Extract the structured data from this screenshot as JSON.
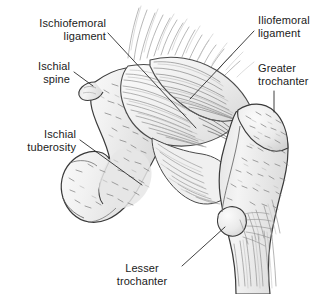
{
  "figure": {
    "background_color": "#ffffff",
    "width": 320,
    "height": 294,
    "ink_color": "#1b1b1b",
    "bone_fill": "#efefef",
    "bone_shade": "#d8d8d8",
    "ligament_fill": "#f4f4f4",
    "line_color": "#2b2b2b"
  },
  "labels": [
    {
      "id": "ischiofemoral-ligament",
      "text": "Ischiofemoral\nligament",
      "align": "right",
      "x": 14,
      "y": 17,
      "width": 92,
      "leader": {
        "x1": 108,
        "y1": 33,
        "x2": 196,
        "y2": 128
      }
    },
    {
      "id": "ischial-spine",
      "text": "Ischial\nspine",
      "align": "right",
      "x": 8,
      "y": 60,
      "width": 62,
      "leader": {
        "x1": 74,
        "y1": 72,
        "x2": 93,
        "y2": 86
      }
    },
    {
      "id": "ischial-tuberosity",
      "text": "Ischial\ntuberosity",
      "align": "right",
      "x": 4,
      "y": 128,
      "width": 72,
      "leader": {
        "x1": 80,
        "y1": 140,
        "x2": 142,
        "y2": 185
      }
    },
    {
      "id": "iliofemoral-ligament",
      "text": "Iliofemoral\nligament",
      "align": "left",
      "x": 258,
      "y": 14,
      "width": 62,
      "leader": {
        "x1": 254,
        "y1": 31,
        "x2": 190,
        "y2": 99
      }
    },
    {
      "id": "greater-trochanter",
      "text": "Greater\ntrochanter",
      "align": "left",
      "x": 258,
      "y": 62,
      "width": 62,
      "leader": {
        "x1": 274,
        "y1": 91,
        "x2": 274,
        "y2": 112
      }
    },
    {
      "id": "lesser-trochanter",
      "text": "Lesser\ntrochanter",
      "align": "center",
      "x": 104,
      "y": 262,
      "width": 76,
      "leader": {
        "x1": 182,
        "y1": 266,
        "x2": 225,
        "y2": 227
      }
    }
  ],
  "structures": [
    {
      "id": "ischium",
      "name": "Ischium"
    },
    {
      "id": "ischial-spine-landmark",
      "name": "Ischial spine"
    },
    {
      "id": "ischial-tuberosity-landmark",
      "name": "Ischial tuberosity"
    },
    {
      "id": "ischiofemoral-ligament-band",
      "name": "Ischiofemoral ligament"
    },
    {
      "id": "iliofemoral-ligament-band",
      "name": "Iliofemoral ligament"
    },
    {
      "id": "femur",
      "name": "Femur"
    },
    {
      "id": "greater-trochanter-landmark",
      "name": "Greater trochanter"
    },
    {
      "id": "lesser-trochanter-landmark",
      "name": "Lesser trochanter"
    }
  ]
}
